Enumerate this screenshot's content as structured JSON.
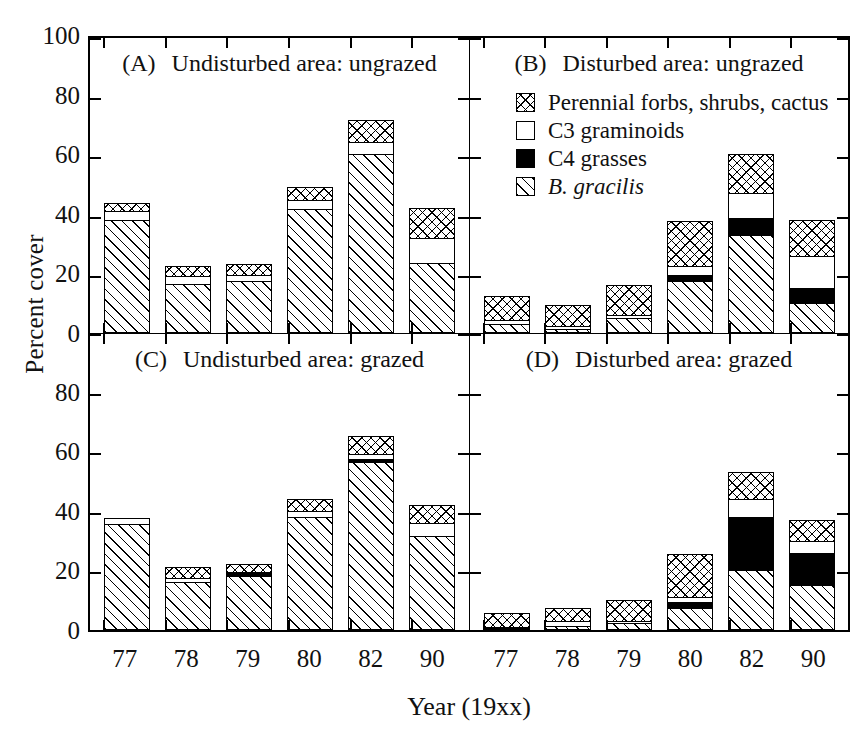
{
  "chart_data": {
    "type": "bar",
    "subtype": "stacked-bar-grid",
    "title": "",
    "xlabel": "Year (19xx)",
    "ylabel": "Percent cover",
    "ylim": [
      0,
      100
    ],
    "yticks": [
      0,
      20,
      40,
      60,
      80,
      100
    ],
    "ytick_labels": [
      "0",
      "20",
      "40",
      "60",
      "80",
      "100"
    ],
    "grid": false,
    "categories": [
      "77",
      "78",
      "79",
      "80",
      "82",
      "90"
    ],
    "legend_position": "top-right-inside-panel-B",
    "series": [
      {
        "name": "B. gracilis",
        "key": "bgracilis",
        "fill": "diagonal-hatch",
        "italic": true
      },
      {
        "name": "C4 grasses",
        "key": "c4",
        "fill": "solid-black",
        "italic": false
      },
      {
        "name": "C3 graminoids",
        "key": "c3",
        "fill": "white",
        "italic": false
      },
      {
        "name": "Perennial forbs, shrubs, cactus",
        "key": "perennial",
        "fill": "cross-hatch",
        "italic": false
      }
    ],
    "panels": [
      {
        "tag": "(A)",
        "title": "Undisturbed area: ungrazed",
        "position": "top-left",
        "values": {
          "bgracilis": [
            38.0,
            16.5,
            17.5,
            41.5,
            60.0,
            23.5
          ],
          "c4": [
            0.0,
            0.0,
            0.0,
            0.0,
            0.0,
            0.0
          ],
          "c3": [
            3.0,
            2.5,
            2.0,
            3.0,
            4.0,
            8.5
          ],
          "perennial": [
            2.5,
            3.5,
            3.5,
            4.5,
            7.5,
            10.0
          ]
        },
        "totals": [
          43.5,
          22.5,
          23.0,
          49.0,
          71.5,
          42.0
        ]
      },
      {
        "tag": "(B)",
        "title": "Disturbed area: ungrazed",
        "position": "top-right",
        "values": {
          "bgracilis": [
            3.0,
            1.5,
            5.0,
            17.5,
            33.0,
            10.0
          ],
          "c4": [
            0.0,
            0.0,
            0.0,
            2.0,
            5.5,
            5.0
          ],
          "c3": [
            1.5,
            1.0,
            1.0,
            3.0,
            8.5,
            11.0
          ],
          "perennial": [
            8.0,
            7.0,
            10.0,
            15.0,
            13.0,
            12.0
          ]
        },
        "totals": [
          12.5,
          9.5,
          16.0,
          37.5,
          60.0,
          38.0
        ]
      },
      {
        "tag": "(C)",
        "title": "Undisturbed area: grazed",
        "position": "bottom-left",
        "values": {
          "bgracilis": [
            35.5,
            16.0,
            18.0,
            38.0,
            56.5,
            31.5
          ],
          "c4": [
            0.0,
            0.0,
            1.0,
            0.0,
            1.0,
            0.0
          ],
          "c3": [
            2.0,
            1.5,
            0.5,
            2.0,
            1.5,
            4.5
          ],
          "perennial": [
            0.0,
            3.5,
            2.5,
            4.0,
            6.0,
            6.0
          ]
        },
        "totals": [
          37.5,
          21.0,
          22.0,
          44.0,
          65.0,
          42.0
        ]
      },
      {
        "tag": "(D)",
        "title": "Disturbed area: grazed",
        "position": "bottom-right",
        "values": {
          "bgracilis": [
            0.5,
            1.5,
            2.5,
            7.5,
            20.0,
            15.0
          ],
          "c4": [
            0.0,
            0.0,
            0.0,
            2.0,
            18.0,
            11.0
          ],
          "c3": [
            0.5,
            1.5,
            0.5,
            1.5,
            6.0,
            4.0
          ],
          "perennial": [
            4.5,
            4.5,
            7.0,
            14.5,
            9.0,
            7.0
          ]
        },
        "totals": [
          5.5,
          7.5,
          10.0,
          25.5,
          53.0,
          37.0
        ]
      }
    ]
  },
  "axis": {
    "ylabel": "Percent cover",
    "xlabel": "Year (19xx)",
    "ytick_labels": [
      "100",
      "80",
      "60",
      "40",
      "20",
      "0"
    ],
    "xtick_labels": [
      "77",
      "78",
      "79",
      "80",
      "82",
      "90"
    ]
  },
  "legend": {
    "items": [
      {
        "label": "Perennial forbs, shrubs, cactus",
        "swatch": "cross-hatch"
      },
      {
        "label": "C3 graminoids",
        "swatch": "white"
      },
      {
        "label": "C4 grasses",
        "swatch": "solid-black"
      },
      {
        "label": "B. gracilis",
        "swatch": "diagonal-hatch"
      }
    ]
  },
  "panels": {
    "a": {
      "tag": "(A)",
      "title": "Undisturbed area: ungrazed"
    },
    "b": {
      "tag": "(B)",
      "title": "Disturbed area: ungrazed"
    },
    "c": {
      "tag": "(C)",
      "title": "Undisturbed area: grazed"
    },
    "d": {
      "tag": "(D)",
      "title": "Disturbed area: grazed"
    }
  }
}
